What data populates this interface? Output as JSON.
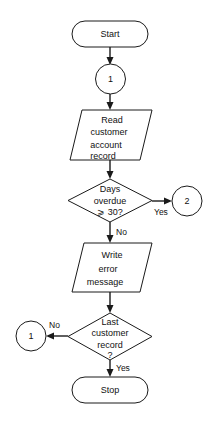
{
  "diagram": {
    "type": "flowchart",
    "background_color": "#ffffff",
    "line_color": "#1a1a1a",
    "text_color": "#111111"
  },
  "nodes": {
    "start": {
      "shape": "terminator",
      "label": "Start"
    },
    "connector_in_1": {
      "shape": "connector-circle",
      "label": "1"
    },
    "read_record": {
      "shape": "parallelogram",
      "line1": "Read",
      "line2": "customer",
      "line3": "account",
      "line4": "record"
    },
    "decision_overdue": {
      "shape": "diamond",
      "line1": "Days",
      "line2": "overdue",
      "line3": "⩾ 30?"
    },
    "connector_out_2": {
      "shape": "connector-circle",
      "label": "2"
    },
    "write_error": {
      "shape": "parallelogram",
      "line1": "Write",
      "line2": "error",
      "line3": "message"
    },
    "decision_last_record": {
      "shape": "diamond",
      "line1": "Last",
      "line2": "customer",
      "line3": "record",
      "line4": "?"
    },
    "connector_out_1": {
      "shape": "connector-circle",
      "label": "1"
    },
    "stop": {
      "shape": "terminator",
      "label": "Stop"
    }
  },
  "edge_labels": {
    "overdue_yes": "Yes",
    "overdue_no": "No",
    "last_record_no": "No",
    "last_record_yes": "Yes"
  }
}
